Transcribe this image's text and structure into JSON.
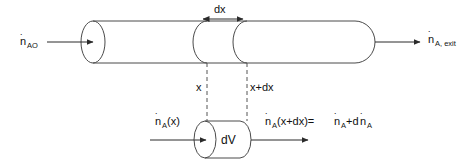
{
  "figure": {
    "background_color": "#ffffff",
    "line_color": "#4a4a4a",
    "text_color": "#111111"
  },
  "labels": {
    "inlet_base": "n",
    "inlet_sub": "AO",
    "exit_base": "n",
    "exit_sub": "A, exit",
    "dx": "dx",
    "x": "x",
    "x_plus_dx": "x+dx",
    "cv_in_base": "n",
    "cv_in_sub": "A",
    "cv_in_arg": "(x)",
    "cv_volume": "dV",
    "cv_out_base": "n",
    "cv_out_sub": "A",
    "cv_out_arg": "(x+dx)=",
    "cv_out_rhs_base": "n",
    "cv_out_rhs_sub": "A",
    "cv_out_plus": "+d",
    "cv_out_tail_base": "n",
    "cv_out_tail_sub": "A",
    "dot": "˙"
  },
  "geometry": {
    "main_tube": {
      "left_cap_center_x": 93,
      "left_cap_rx": 12,
      "top_y": 21,
      "bottom_y": 63,
      "right_end_x": 375
    },
    "section_x": 207,
    "section_x_plus_dx": 247,
    "control_volume": {
      "left_cap_center_x": 205,
      "top_y": 121,
      "bottom_y": 158,
      "right_end_x": 250
    }
  }
}
